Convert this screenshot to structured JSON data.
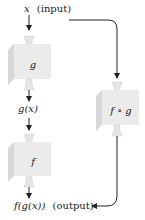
{
  "diagram": {
    "input_label": {
      "var": "x",
      "text": "(input)"
    },
    "intermediate_label": "g(x)",
    "output_label": {
      "expr": "f(g(x))",
      "text": "(output)"
    },
    "boxes": [
      {
        "id": "g",
        "label": "g"
      },
      {
        "id": "f",
        "label": "f"
      },
      {
        "id": "fog",
        "label": "f ∘ g"
      }
    ],
    "colors": {
      "box_front": "#ebebeb",
      "box_side": "#d8d8d8",
      "box_top": "#f4f4f4",
      "funnel": "#e2e2e2",
      "arrow": "#222222"
    }
  }
}
